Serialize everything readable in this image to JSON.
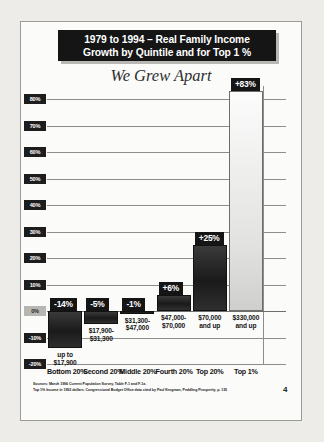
{
  "slide": {
    "title_line1": "1979 to 1994 – Real Family Income",
    "title_line2": "Growth by Quintile and for Top 1 %",
    "subtitle": "We Grew Apart",
    "page_number": "4",
    "sources_line1": "Sources: March 1996 Current Population Survey, Table F-1 and F-1a.",
    "sources_line2": "Top 1% Income in 1993 dollars. Congressional Budget Office data cited by Paul Krugman, Peddling Prosperity, p. 135"
  },
  "colors": {
    "title_background": "#151515",
    "title_text": "#ffffff",
    "badge_background": "#151515",
    "bar_dark": "#1a1a1a",
    "bar_light": "#e2e2e0",
    "page_background": "#fbfbfa",
    "gridline": "#8d8d8a",
    "zero_tick": "#b6b6b2"
  },
  "chart_data": {
    "type": "bar",
    "title": "1979 to 1994 – Real Family Income Growth by Quintile and for Top 1 %",
    "subtitle": "We Grew Apart",
    "xlabel": "",
    "ylabel": "",
    "ylim": [
      -20,
      85
    ],
    "grid": true,
    "legend": "none",
    "categories": [
      "Bottom 20%",
      "Second 20%",
      "Middle 20%",
      "Fourth 20%",
      "Top 20%",
      "Top 1%"
    ],
    "values": [
      -14,
      -5,
      -1,
      6,
      25,
      83
    ],
    "value_labels": [
      "-14%",
      "-5%",
      "-1%",
      "+6%",
      "+25%",
      "+83%"
    ],
    "income_ranges": [
      "up to\n$17,900",
      "$17,900-\n$31,300",
      "$31,300-\n$47,000",
      "$47,000-\n$70,000",
      "$70,000\nand up",
      "$330,000\nand up"
    ],
    "income_ranges_line1": [
      "up to",
      "$17,900-",
      "$31,300-",
      "$47,000-",
      "$70,000",
      "$330,000"
    ],
    "income_ranges_line2": [
      "$17,900",
      "$31,300",
      "$47,000",
      "$70,000",
      "and up",
      "and up"
    ],
    "bar_colors": [
      "#1a1a1a",
      "#1a1a1a",
      "#1a1a1a",
      "#1a1a1a",
      "#1a1a1a",
      "#e2e2e0"
    ],
    "ytick_labels": [
      "80%",
      "70%",
      "60%",
      "50%",
      "40%",
      "30%",
      "20%",
      "10%",
      "0%",
      "-10%",
      "-20%"
    ],
    "ytick_values": [
      80,
      70,
      60,
      50,
      40,
      30,
      20,
      10,
      0,
      -10,
      -20
    ]
  }
}
